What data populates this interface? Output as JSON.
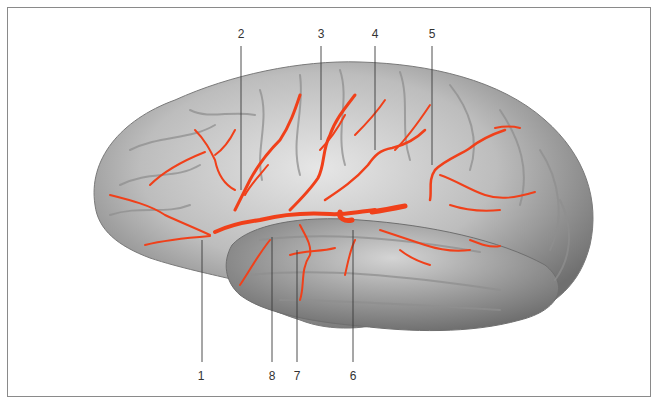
{
  "figure": {
    "artery_color": "#f0401a",
    "brain_tone": "#b8b8b8",
    "frame_color": "#8a8a8a"
  },
  "labels": {
    "top": [
      {
        "id": "label-2",
        "text": "2",
        "x": 241,
        "y": 32,
        "target_x": 241,
        "target_y": 190
      },
      {
        "id": "label-3",
        "text": "3",
        "x": 321,
        "y": 32,
        "target_x": 321,
        "target_y": 140
      },
      {
        "id": "label-4",
        "text": "4",
        "x": 375,
        "y": 32,
        "target_x": 375,
        "target_y": 150
      },
      {
        "id": "label-5",
        "text": "5",
        "x": 432,
        "y": 32,
        "target_x": 432,
        "target_y": 165
      }
    ],
    "bottom": [
      {
        "id": "label-1",
        "text": "1",
        "x": 201,
        "y": 375,
        "target_x": 202,
        "target_y": 240
      },
      {
        "id": "label-8",
        "text": "8",
        "x": 272,
        "y": 375,
        "target_x": 272,
        "target_y": 237
      },
      {
        "id": "label-7",
        "text": "7",
        "x": 297,
        "y": 375,
        "target_x": 297,
        "target_y": 250
      },
      {
        "id": "label-6",
        "text": "6",
        "x": 353,
        "y": 375,
        "target_x": 353,
        "target_y": 230
      }
    ]
  }
}
